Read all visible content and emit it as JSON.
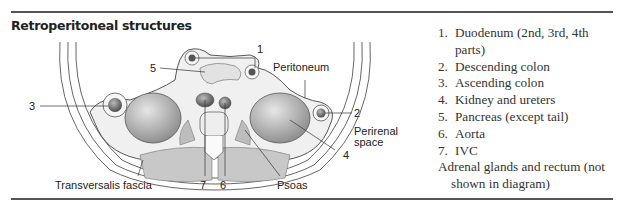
{
  "header": {
    "title": "Retroperitoneal structures"
  },
  "diagram": {
    "labels": {
      "n1": "1",
      "n2": "2",
      "n3": "3",
      "n4": "4",
      "n5": "5",
      "n6": "6",
      "n7": "7",
      "peritoneum": "Peritoneum",
      "perirenal_line1": "Perirenal",
      "perirenal_line2": "space",
      "transversalis": "Transversalis fascia",
      "psoas": "Psoas"
    }
  },
  "list": {
    "items": [
      {
        "num": "1.",
        "text": "Duodenum (2nd, 3rd, 4th parts)"
      },
      {
        "num": "2.",
        "text": "Descending colon"
      },
      {
        "num": "3.",
        "text": "Ascending colon"
      },
      {
        "num": "4.",
        "text": "Kidney and ureters"
      },
      {
        "num": "5.",
        "text": "Pancreas (except tail)"
      },
      {
        "num": "6.",
        "text": "Aorta"
      },
      {
        "num": "7.",
        "text": "IVC"
      }
    ],
    "note": "Adrenal glands and rectum (not shown in diagram)"
  }
}
